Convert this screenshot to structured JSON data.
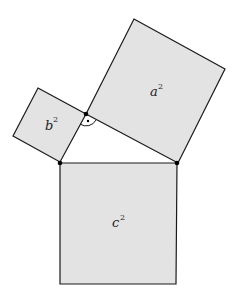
{
  "diagram": {
    "squares": [
      {
        "id": "a",
        "label": "a",
        "exponent": "2"
      },
      {
        "id": "b",
        "label": "b",
        "exponent": "2"
      },
      {
        "id": "c",
        "label": "c",
        "exponent": "2"
      }
    ],
    "right_angle_marker": "dot-in-arc",
    "colors": {
      "fill": "#e3e3e3",
      "stroke": "#1a1a1a",
      "background": "#ffffff"
    }
  }
}
